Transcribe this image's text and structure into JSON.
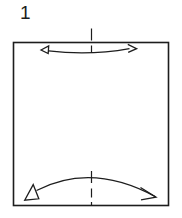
{
  "figure": {
    "step_label": "1",
    "colors": {
      "line": "#1d1d1d",
      "paper": "#ffffff",
      "background": "#ffffff"
    }
  }
}
